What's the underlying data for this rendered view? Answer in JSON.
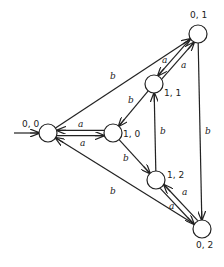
{
  "diagram": {
    "type": "state-transition-graph",
    "nodes": [
      {
        "id": "n00",
        "label": "0, 0",
        "x": 48,
        "y": 133,
        "lx": 22,
        "ly": 127,
        "start": true
      },
      {
        "id": "n10",
        "label": "1, 0",
        "x": 113,
        "y": 133,
        "lx": 123,
        "ly": 137
      },
      {
        "id": "n11",
        "label": "1, 1",
        "x": 154,
        "y": 84,
        "lx": 164,
        "ly": 96
      },
      {
        "id": "n01",
        "label": "0, 1",
        "x": 198,
        "y": 34,
        "lx": 190,
        "ly": 18
      },
      {
        "id": "n12",
        "label": "1, 2",
        "x": 156,
        "y": 180,
        "lx": 167,
        "ly": 178
      },
      {
        "id": "n02",
        "label": "0, 2",
        "x": 202,
        "y": 229,
        "lx": 196,
        "ly": 248
      }
    ],
    "edges": [
      {
        "from": "n00",
        "to": "n10",
        "label": "a",
        "lx": 78,
        "ly": 127
      },
      {
        "from": "n10",
        "to": "n00",
        "label": "a",
        "lx": 80,
        "ly": 146
      },
      {
        "from": "n00",
        "to": "n01",
        "label": "b",
        "lx": 110,
        "ly": 79
      },
      {
        "from": "n11",
        "to": "n01",
        "label": "a",
        "lx": 162,
        "ly": 63
      },
      {
        "from": "n01",
        "to": "n11",
        "label": "a",
        "lx": 181,
        "ly": 68
      },
      {
        "from": "n11",
        "to": "n10",
        "label": "b",
        "lx": 128,
        "ly": 103
      },
      {
        "from": "n10",
        "to": "n12",
        "label": "b",
        "lx": 123,
        "ly": 161
      },
      {
        "from": "n12",
        "to": "n11",
        "label": "b",
        "lx": 160,
        "ly": 134
      },
      {
        "from": "n01",
        "to": "n02",
        "label": "b",
        "lx": 205,
        "ly": 134
      },
      {
        "from": "n12",
        "to": "n02",
        "label": "a",
        "lx": 182,
        "ly": 195
      },
      {
        "from": "n02",
        "to": "n12",
        "label": "a",
        "lx": 169,
        "ly": 209
      },
      {
        "from": "n02",
        "to": "n00",
        "label": "b",
        "lx": 110,
        "ly": 194
      }
    ]
  }
}
